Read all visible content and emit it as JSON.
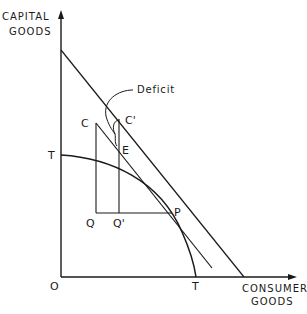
{
  "axes": {
    "y_label_line1": "CAPITAL",
    "y_label_line2": "GOODS",
    "x_label_line1": "CONSUMER",
    "x_label_line2": "GOODS",
    "origin": "O"
  },
  "points": {
    "T_y": "T",
    "T_x": "T",
    "C": "C",
    "C_prime": "C'",
    "E": "E",
    "Q": "Q",
    "Q_prime": "Q'",
    "P": "P"
  },
  "annotation": {
    "deficit": "Deficit"
  },
  "colors": {
    "ink": "#1a1a1a",
    "background": "#ffffff"
  }
}
